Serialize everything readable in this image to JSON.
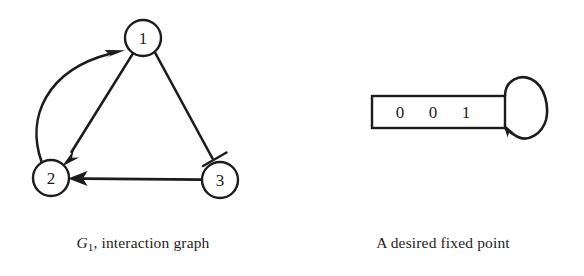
{
  "figure": {
    "background_color": "#ffffff",
    "ink_color": "#1c1c1c",
    "panels": [
      {
        "id": "interaction-graph",
        "caption_plain": "G1, interaction graph",
        "caption_symbol": "G",
        "caption_subscript": "1",
        "caption_rest": ", interaction graph"
      },
      {
        "id": "fixed-point",
        "caption_plain": "A desired fixed point"
      }
    ]
  },
  "graph": {
    "title": "G1, interaction graph",
    "node_radius": 18,
    "nodes": [
      {
        "id": "1",
        "label": "1",
        "cx": 143,
        "cy": 38
      },
      {
        "id": "2",
        "label": "2",
        "cx": 51,
        "cy": 178
      },
      {
        "id": "3",
        "label": "3",
        "cx": 220,
        "cy": 180
      }
    ],
    "edges": [
      {
        "from": "2",
        "to": "1",
        "style": "curved",
        "arrowhead": "solid-triangle"
      },
      {
        "from": "1",
        "to": "2",
        "style": "straight",
        "arrowhead": "solid-triangle"
      },
      {
        "from": "1",
        "to": "3",
        "style": "straight",
        "arrowhead": "half-barb"
      },
      {
        "from": "3",
        "to": "2",
        "style": "straight",
        "arrowhead": "solid-triangle"
      }
    ]
  },
  "tape": {
    "title": "A desired fixed point",
    "cells": [
      "0",
      "0",
      "1"
    ],
    "cell_count": 3,
    "rect": {
      "x": 372,
      "y": 96,
      "width": 133,
      "height": 32
    },
    "self_loop": {
      "present": true,
      "arrowhead": "solid-triangle",
      "side": "right"
    }
  }
}
